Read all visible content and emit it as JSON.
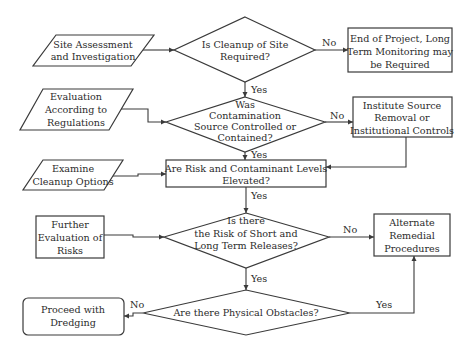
{
  "diagram": {
    "type": "flowchart",
    "nodes": {
      "site_assessment": {
        "shape": "parallelogram",
        "lines": [
          "Site Assessment",
          "and Investigation"
        ]
      },
      "cleanup_required": {
        "shape": "diamond",
        "lines": [
          "Is Cleanup of Site",
          "Required?"
        ]
      },
      "end_of_project": {
        "shape": "rectangle",
        "lines": [
          "End of Project, Long",
          "Term Monitoring may",
          "be Required"
        ]
      },
      "evaluation_regulations": {
        "shape": "parallelogram",
        "lines": [
          "Evaluation",
          "According to",
          "Regulations"
        ]
      },
      "source_controlled": {
        "shape": "diamond",
        "lines": [
          "Was",
          "Contamination",
          "Source Controlled or",
          "Contained?"
        ]
      },
      "institute_source_removal": {
        "shape": "rectangle",
        "lines": [
          "Institute Source",
          "Removal or",
          "Institutional Controls"
        ]
      },
      "examine_cleanup": {
        "shape": "parallelogram",
        "lines": [
          "Examine",
          "Cleanup Options"
        ]
      },
      "risk_elevated": {
        "shape": "rectangle",
        "lines": [
          "Are Risk and Contaminant Levels",
          "Elevated?"
        ]
      },
      "further_evaluation": {
        "shape": "rectangle",
        "lines": [
          "Further",
          "Evaluation of",
          "Risks"
        ]
      },
      "release_risk": {
        "shape": "diamond",
        "lines": [
          "Is there",
          "the Risk of Short and",
          "Long Term Releases?"
        ]
      },
      "alternate_remedial": {
        "shape": "rectangle",
        "lines": [
          "Alternate",
          "Remedial",
          "Procedures"
        ]
      },
      "physical_obstacles": {
        "shape": "diamond",
        "lines": [
          "Are there Physical Obstacles?"
        ]
      },
      "proceed_dredging": {
        "shape": "rounded-rectangle",
        "lines": [
          "Proceed with",
          "Dredging"
        ]
      }
    },
    "edges": [
      {
        "from": "site_assessment",
        "to": "cleanup_required",
        "label": ""
      },
      {
        "from": "cleanup_required",
        "to": "end_of_project",
        "label": "No"
      },
      {
        "from": "cleanup_required",
        "to": "source_controlled",
        "label": "Yes"
      },
      {
        "from": "evaluation_regulations",
        "to": "source_controlled",
        "label": ""
      },
      {
        "from": "source_controlled",
        "to": "institute_source_removal",
        "label": "No"
      },
      {
        "from": "source_controlled",
        "to": "risk_elevated",
        "label": "Yes"
      },
      {
        "from": "institute_source_removal",
        "to": "risk_elevated",
        "label": ""
      },
      {
        "from": "examine_cleanup",
        "to": "risk_elevated",
        "label": ""
      },
      {
        "from": "risk_elevated",
        "to": "release_risk",
        "label": "Yes"
      },
      {
        "from": "further_evaluation",
        "to": "release_risk",
        "label": ""
      },
      {
        "from": "release_risk",
        "to": "alternate_remedial",
        "label": "No"
      },
      {
        "from": "release_risk",
        "to": "physical_obstacles",
        "label": "Yes"
      },
      {
        "from": "physical_obstacles",
        "to": "proceed_dredging",
        "label": "No"
      },
      {
        "from": "physical_obstacles",
        "to": "alternate_remedial",
        "label": "Yes"
      }
    ],
    "labels": {
      "no": "No",
      "yes": "Yes"
    },
    "colors": {
      "stroke": "#3a3a3a",
      "text": "#2b2b2b",
      "background": "#ffffff"
    }
  }
}
